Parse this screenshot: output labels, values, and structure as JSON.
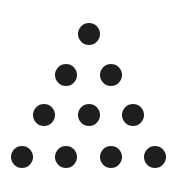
{
  "diagram": {
    "type": "triangular-number-dots",
    "rows": 4,
    "total_dots": 10,
    "dot_color": "#1e1e1e",
    "background": "#ffffff",
    "dot_radius": 11,
    "dots": [
      {
        "row": 1,
        "cx": 89,
        "cy": 34
      },
      {
        "row": 2,
        "cx": 66,
        "cy": 75
      },
      {
        "row": 2,
        "cx": 111,
        "cy": 75
      },
      {
        "row": 3,
        "cx": 44,
        "cy": 115
      },
      {
        "row": 3,
        "cx": 89,
        "cy": 115
      },
      {
        "row": 3,
        "cx": 133,
        "cy": 115
      },
      {
        "row": 4,
        "cx": 22,
        "cy": 157
      },
      {
        "row": 4,
        "cx": 66,
        "cy": 157
      },
      {
        "row": 4,
        "cx": 111,
        "cy": 157
      },
      {
        "row": 4,
        "cx": 155,
        "cy": 157
      }
    ]
  }
}
